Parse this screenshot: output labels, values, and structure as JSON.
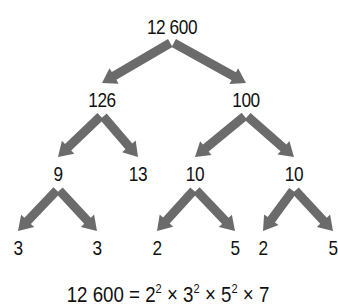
{
  "arrow_color": "#6b6b6b",
  "text_color": "#111111",
  "nodes": [
    {
      "id": "n12600",
      "label": "12 600",
      "x": 172,
      "y": 16
    },
    {
      "id": "n126",
      "label": "126",
      "x": 102,
      "y": 89
    },
    {
      "id": "n100",
      "label": "100",
      "x": 246,
      "y": 89
    },
    {
      "id": "n9",
      "label": "9",
      "x": 58,
      "y": 163
    },
    {
      "id": "n13",
      "label": "13",
      "x": 138,
      "y": 163
    },
    {
      "id": "n10a",
      "label": "10",
      "x": 195,
      "y": 163
    },
    {
      "id": "n10b",
      "label": "10",
      "x": 294,
      "y": 163
    },
    {
      "id": "n3a",
      "label": "3",
      "x": 18,
      "y": 237
    },
    {
      "id": "n3b",
      "label": "3",
      "x": 97,
      "y": 237
    },
    {
      "id": "n2a",
      "label": "2",
      "x": 157,
      "y": 237
    },
    {
      "id": "n5a",
      "label": "5",
      "x": 235,
      "y": 237
    },
    {
      "id": "n2b",
      "label": "2",
      "x": 263,
      "y": 237
    },
    {
      "id": "n5b",
      "label": "5",
      "x": 333,
      "y": 237
    }
  ],
  "edges": [
    {
      "from": "n12600",
      "to": "n126"
    },
    {
      "from": "n12600",
      "to": "n100"
    },
    {
      "from": "n126",
      "to": "n9"
    },
    {
      "from": "n126",
      "to": "n13"
    },
    {
      "from": "n100",
      "to": "n10a"
    },
    {
      "from": "n100",
      "to": "n10b"
    },
    {
      "from": "n9",
      "to": "n3a"
    },
    {
      "from": "n9",
      "to": "n3b"
    },
    {
      "from": "n10a",
      "to": "n2a"
    },
    {
      "from": "n10a",
      "to": "n5a"
    },
    {
      "from": "n10b",
      "to": "n2b"
    },
    {
      "from": "n10b",
      "to": "n5b"
    }
  ],
  "equation": {
    "lhs": "12 600",
    "eq": "=",
    "terms": [
      {
        "base": "2",
        "exp": "2"
      },
      {
        "base": "3",
        "exp": "2"
      },
      {
        "base": "5",
        "exp": "2"
      },
      {
        "base": "7",
        "exp": ""
      }
    ],
    "times": "×"
  }
}
